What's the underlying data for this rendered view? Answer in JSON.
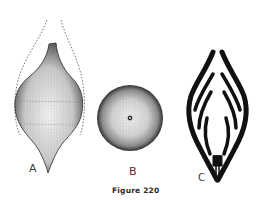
{
  "figure": {
    "caption": "Figure 220",
    "panels": [
      {
        "id": "A",
        "label": "A",
        "description": "spindle-shaped stippled body with dashed outer outline"
      },
      {
        "id": "B",
        "label": "B",
        "description": "circular stippled cross-section with central dot"
      },
      {
        "id": "C",
        "label": "C",
        "description": "black leaf-shaped outline with branching internal ribs"
      }
    ]
  },
  "colors": {
    "ink": "#1a1a1a",
    "background": "#ffffff"
  }
}
